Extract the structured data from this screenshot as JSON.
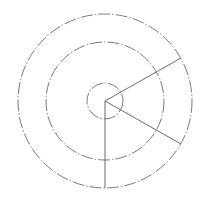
{
  "diagram": {
    "width": 209,
    "height": 206,
    "background": "#ffffff",
    "stroke_color": "#6b6b6b",
    "circle_color": "#7a7a7a",
    "center": {
      "x": 105,
      "y": 101
    },
    "circles": [
      {
        "name": "inner-circle",
        "r": 18,
        "style": "dash-dot"
      },
      {
        "name": "middle-circle",
        "r": 59,
        "style": "dash-dot"
      },
      {
        "name": "outer-circle",
        "r": 87,
        "style": "dash-dot"
      }
    ],
    "radial_lines": [
      {
        "name": "radial-line-upper-right",
        "x2": 181,
        "y2": 58
      },
      {
        "name": "radial-line-lower-right",
        "x2": 181,
        "y2": 144
      },
      {
        "name": "radial-line-down",
        "x2": 105,
        "y2": 188
      }
    ]
  }
}
